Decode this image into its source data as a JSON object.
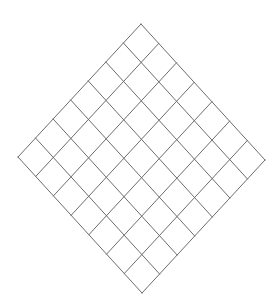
{
  "figure": {
    "type": "geometric-diagram",
    "background_color": "#ffffff",
    "line_color": "#6d6d6d",
    "line_width": 1,
    "fill_color": "#ffffff"
  },
  "canvas": {
    "width": 280,
    "height": 303
  },
  "grid": {
    "rows": 7,
    "columns": 7,
    "total_cells": 49,
    "rotation_degrees": 45,
    "shape": "diamond",
    "cell_shape": "square",
    "vertices_per_side": 8,
    "vertices": {
      "top": {
        "x": 141,
        "y": 24
      },
      "left": {
        "x": 18,
        "y": 157
      },
      "right": {
        "x": 265,
        "y": 160
      },
      "bottom": {
        "x": 143,
        "y": 287
      }
    },
    "edge_step_u": {
      "dx": -17.571,
      "dy": 19.0
    },
    "edge_step_v": {
      "dx": 17.714,
      "dy": 19.429
    },
    "origin": {
      "x": 141,
      "y": 24
    }
  }
}
